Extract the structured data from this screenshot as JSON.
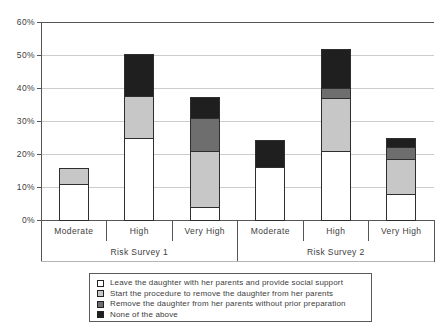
{
  "chart_data": {
    "type": "bar",
    "stacked": true,
    "title": "",
    "ylim": [
      0,
      60
    ],
    "ytick_step": 10,
    "ytick_suffix": "%",
    "y_tick_labels": [
      "0%",
      "10%",
      "20%",
      "30%",
      "40%",
      "50%",
      "60%"
    ],
    "grid": true,
    "legend_position": "bottom",
    "groups": [
      {
        "label": "Risk Survey 1",
        "categories": [
          "Moderate",
          "High",
          "Very High"
        ]
      },
      {
        "label": "Risk Survey 2",
        "categories": [
          "Moderate",
          "High",
          "Very High"
        ]
      }
    ],
    "series": [
      {
        "name": "Leave the daughter with her parents and provide social support",
        "color": "#ffffff",
        "values": [
          11,
          25,
          4,
          16,
          21,
          8
        ]
      },
      {
        "name": "Start the procedure to remove the daughter from her parents",
        "color": "#c7c7c7",
        "values": [
          4.5,
          12.5,
          17,
          0,
          16,
          10.5
        ]
      },
      {
        "name": "Remove the daughter from her parents without prior preparation",
        "color": "#6e6e6e",
        "values": [
          0,
          0,
          10,
          0,
          3,
          3.5
        ]
      },
      {
        "name": "None of the above",
        "color": "#1f1f1f",
        "values": [
          0,
          12.5,
          6,
          8,
          11.5,
          2.5
        ]
      }
    ]
  },
  "style": {
    "grid_color": "#cccccc",
    "axis_color": "#565656",
    "bar_border_color": "#2e2e2e",
    "text_color": "#3d3d3d"
  }
}
